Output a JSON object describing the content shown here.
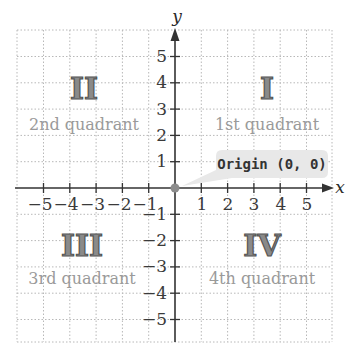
{
  "diagram": {
    "axes": {
      "x_label": "x",
      "y_label": "y",
      "x_ticks": [
        "−5",
        "−4",
        "−3",
        "−2",
        "−1",
        "1",
        "2",
        "3",
        "4",
        "5"
      ],
      "y_ticks": [
        "5",
        "4",
        "3",
        "2",
        "1",
        "−1",
        "−2",
        "−3",
        "−4",
        "−5"
      ]
    },
    "quadrants": [
      {
        "numeral": "I",
        "label": "1st quadrant"
      },
      {
        "numeral": "II",
        "label": "2nd quadrant"
      },
      {
        "numeral": "III",
        "label": "3rd quadrant"
      },
      {
        "numeral": "IV",
        "label": "4th quadrant"
      }
    ],
    "origin_callout": "Origin (0, 0)",
    "colors": {
      "grid": "#b0b0b0",
      "axis": "#333333",
      "numeral_fill": "#8a8a8a",
      "quadrant_text": "#9a9a9a",
      "callout_bg": "#e6e6e6",
      "origin_dot": "#888888"
    }
  }
}
